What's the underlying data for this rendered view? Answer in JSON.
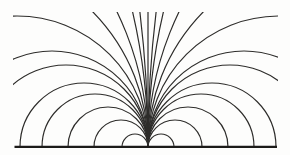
{
  "diagram": {
    "kind": "field-lines-figure",
    "canvas": {
      "width": 290,
      "height": 155,
      "background": "#fdfdfc"
    },
    "line_color": "#2e2d2b",
    "baseline_color": "#1c1b19",
    "curve_stroke_width": 1.2,
    "baseline_stroke_width": 2.3,
    "origin": {
      "x": 148,
      "y": 147
    },
    "clip": {
      "left": 13,
      "top": 12,
      "right": 278,
      "bottom": 147.6
    },
    "baseline": {
      "x1": 14.5,
      "x2": 277,
      "y": 146.8
    },
    "sides": [
      "left",
      "right"
    ],
    "semicircle_radii": [
      13,
      27,
      40,
      53,
      64
    ],
    "edge_exit_radii": [
      82,
      96,
      131
    ],
    "top_exit_radii": [
      193,
      310,
      597,
      1110
    ],
    "has_vertical_line": true
  }
}
